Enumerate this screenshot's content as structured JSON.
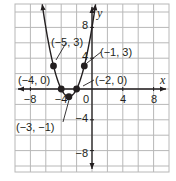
{
  "chart_data": {
    "type": "line",
    "title": "",
    "xlabel": "x",
    "ylabel": "y",
    "xlim": [
      -10,
      10
    ],
    "ylim": [
      -10,
      11
    ],
    "grid": true,
    "grid_step": 2,
    "x_ticks": [
      -8,
      -4,
      0,
      4,
      8
    ],
    "y_ticks": [
      8,
      4,
      -4,
      -8
    ],
    "x_tick_labels": [
      "−8",
      "−4",
      "0",
      "4",
      "8"
    ],
    "y_tick_labels": [
      "8",
      "4",
      "−4",
      "−8"
    ],
    "function": "y = (x + 3)^2 - 1",
    "series": [
      {
        "name": "parabola",
        "x": [
          -5,
          -4,
          -3,
          -2,
          -1
        ],
        "y": [
          3,
          0,
          -1,
          0,
          3
        ]
      }
    ],
    "points": [
      {
        "x": -5,
        "y": 3,
        "label": "(−5, 3)"
      },
      {
        "x": -4,
        "y": 0,
        "label": "(−4, 0)"
      },
      {
        "x": -3,
        "y": -1,
        "label": "(−3, −1)"
      },
      {
        "x": -2,
        "y": 0,
        "label": "(−2, 0)"
      },
      {
        "x": -1,
        "y": 3,
        "label": "(−1, 3)"
      }
    ],
    "colors": {
      "curve": "#231f20",
      "grid": "#b8b8b8",
      "axes": "#231f20",
      "background": "#ffffff"
    }
  }
}
